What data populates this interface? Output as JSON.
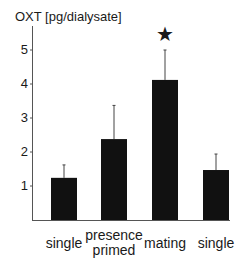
{
  "chart_data": {
    "type": "bar",
    "title": "",
    "ylabel": "OXT [pg/dialysate]",
    "xlabel": "",
    "categories": [
      "single",
      "presence primed",
      "mating",
      "single"
    ],
    "values": [
      1.24,
      2.38,
      4.12,
      1.47
    ],
    "error_upper": [
      1.62,
      3.37,
      5.0,
      1.94
    ],
    "ylim": [
      0,
      5.5
    ],
    "yticks": [
      1,
      2,
      3,
      4,
      5
    ],
    "grid": false,
    "bar_color": "#111111",
    "annotations": [
      {
        "category": "mating",
        "text": "★",
        "meaning": "significant"
      }
    ]
  },
  "labels": {
    "ylabel": "OXT [pg/dialysate]",
    "x0": "single",
    "x1a": "presence",
    "x1b": "primed",
    "x2": "mating",
    "x3": "single",
    "star": "★",
    "t1": "1",
    "t2": "2",
    "t3": "3",
    "t4": "4",
    "t5": "5"
  }
}
